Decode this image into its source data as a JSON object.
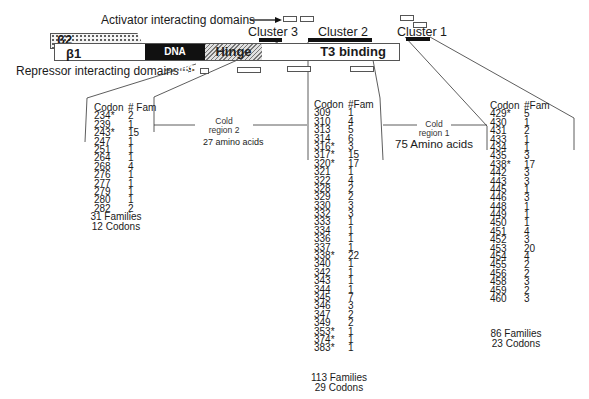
{
  "diagram": {
    "activator_label": "Activator interacting domains",
    "repressor_label": "Repressor interacting domains",
    "b2_label": "β2",
    "b1_label": "β1",
    "dna_binding_label": "DNA binding",
    "hinge_label": "Hinge",
    "t3_binding_label": "T3 binding",
    "clusters": [
      {
        "label": "Cluster 3"
      },
      {
        "label": "Cluster 2"
      },
      {
        "label": "Cluster 1"
      }
    ],
    "cold_regions": [
      {
        "label_line1": "Cold",
        "label_line2": "region 2",
        "length": "27 amino acids"
      },
      {
        "label_line1": "Cold",
        "label_line2": "region 1",
        "length": "75 Amino acids"
      }
    ]
  },
  "tables": {
    "cluster3": {
      "headers": [
        "Codon",
        "# Fam"
      ],
      "rows": [
        [
          "234*",
          "2"
        ],
        [
          "239",
          "1"
        ],
        [
          "243*",
          "15"
        ],
        [
          "247",
          "1"
        ],
        [
          "251",
          "1"
        ],
        [
          "264",
          "1"
        ],
        [
          "268",
          "4"
        ],
        [
          "276",
          "1"
        ],
        [
          "277",
          "1"
        ],
        [
          "279",
          "1"
        ],
        [
          "280",
          "1"
        ],
        [
          "282",
          "2"
        ]
      ],
      "families": "31 Families",
      "codons": "12 Codons"
    },
    "cluster2": {
      "headers": [
        "Codon",
        "#Fam"
      ],
      "rows": [
        [
          "309",
          "1"
        ],
        [
          "310",
          "4"
        ],
        [
          "313",
          "5"
        ],
        [
          "314",
          "6"
        ],
        [
          "316*",
          "3"
        ],
        [
          "317*",
          "15"
        ],
        [
          "320*",
          "17"
        ],
        [
          "321",
          "1"
        ],
        [
          "322",
          "4"
        ],
        [
          "328",
          "2"
        ],
        [
          "329",
          "2"
        ],
        [
          "330",
          "3"
        ],
        [
          "332",
          "3"
        ],
        [
          "333",
          "1"
        ],
        [
          "334",
          "1"
        ],
        [
          "336",
          "1"
        ],
        [
          "337",
          "1"
        ],
        [
          "338*",
          "22"
        ],
        [
          "340",
          "1"
        ],
        [
          "342",
          "1"
        ],
        [
          "343",
          "1"
        ],
        [
          "344",
          "1"
        ],
        [
          "345",
          "7"
        ],
        [
          "346",
          "3"
        ],
        [
          "347",
          "2"
        ],
        [
          "349",
          "2"
        ],
        [
          "353*",
          "1"
        ],
        [
          "374*",
          "1"
        ],
        [
          "383*",
          "1"
        ]
      ],
      "families": "113 Families",
      "codons": "29 Codons"
    },
    "cluster1": {
      "headers": [
        "Codon",
        "#Fam"
      ],
      "rows": [
        [
          "429*",
          "5"
        ],
        [
          "430",
          "1"
        ],
        [
          "431",
          "2"
        ],
        [
          "433",
          "1"
        ],
        [
          "434",
          "1"
        ],
        [
          "435",
          "3"
        ],
        [
          "438*",
          "17"
        ],
        [
          "442",
          "3"
        ],
        [
          "443",
          "3"
        ],
        [
          "445",
          "1"
        ],
        [
          "446",
          "3"
        ],
        [
          "448",
          "1"
        ],
        [
          "449",
          "1"
        ],
        [
          "450",
          "1"
        ],
        [
          "451",
          "4"
        ],
        [
          "452",
          "3"
        ],
        [
          "453",
          "20"
        ],
        [
          "454",
          "4"
        ],
        [
          "455",
          "2"
        ],
        [
          "456",
          "2"
        ],
        [
          "458",
          "3"
        ],
        [
          "459",
          "2"
        ],
        [
          "460",
          "3"
        ]
      ],
      "families": "86 Families",
      "codons": "23 Codons"
    }
  }
}
